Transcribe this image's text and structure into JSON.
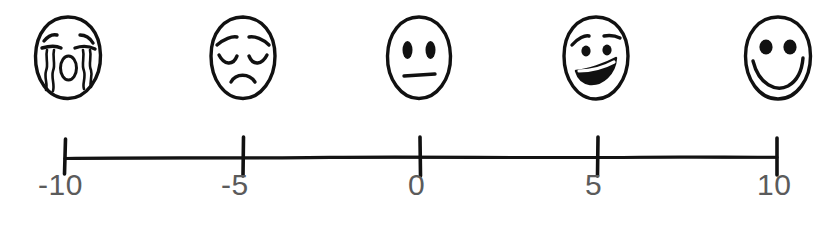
{
  "page": {
    "background_color": "#ffffff",
    "ink_color": "#111111",
    "label_color": "#5b5b5b",
    "width": 838,
    "height": 225
  },
  "scale": {
    "type": "hand-drawn-number-line",
    "orientation": "horizontal",
    "min": -10,
    "max": 10,
    "step": 5,
    "axis_y": 157,
    "axis_start_x": 65,
    "axis_end_x": 777,
    "tick_values": [
      -10,
      -5,
      0,
      5,
      10
    ],
    "tick_labels": [
      "-10",
      "-5",
      "0",
      "5",
      "10"
    ],
    "tick_positions_x": [
      65,
      243,
      420,
      598,
      777
    ],
    "label_positions_x": [
      38,
      221,
      406,
      584,
      757
    ]
  },
  "faces": [
    {
      "name": "crying-face",
      "value": -10,
      "expression": "crying",
      "description": "face with squinting closed eyes, wavy tear streams on both cheeks and an open oval mouth",
      "center_x": 68
    },
    {
      "name": "sad-face",
      "value": -5,
      "expression": "sad",
      "description": "face with worried raised eyebrows, closed downturned eyes and a frowning mouth",
      "center_x": 243
    },
    {
      "name": "neutral-face",
      "value": 0,
      "expression": "neutral",
      "description": "face with two oval eyes and a straight flat mouth",
      "center_x": 419
    },
    {
      "name": "slightly-happy-face",
      "value": 5,
      "expression": "slightly happy",
      "description": "face with small round eyes, eyebrow strokes and an asymmetric open grin",
      "center_x": 596
    },
    {
      "name": "happy-face",
      "value": 10,
      "expression": "happy",
      "description": "face with two large round eyes and a wide open smile",
      "center_x": 778
    }
  ]
}
